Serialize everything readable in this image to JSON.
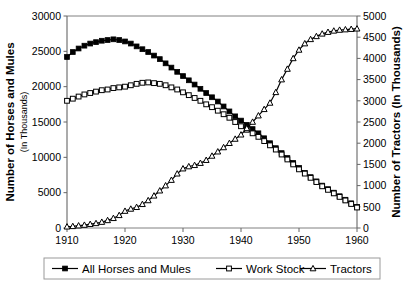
{
  "chart_data": {
    "type": "line",
    "title": "",
    "xlabel": "",
    "ylabel": "Number of Horses and Mules",
    "ylabel_sub": "(In Thousands)",
    "y2label": "Number of Tractors (In Thousands)",
    "grid": false,
    "legend_position": "bottom",
    "xlim": [
      1910,
      1960
    ],
    "xticks": [
      1910,
      1920,
      1930,
      1940,
      1950,
      1960
    ],
    "xtick_labels": [
      "1910",
      "1920",
      "1930",
      "1940",
      "1950",
      "1960"
    ],
    "ylim": [
      0,
      30000
    ],
    "yticks": [
      0,
      5000,
      10000,
      15000,
      20000,
      25000,
      30000
    ],
    "ytick_labels": [
      "0",
      "5000",
      "10000",
      "15000",
      "20000",
      "25000",
      "30000"
    ],
    "y2lim": [
      0,
      5000
    ],
    "y2ticks": [
      0,
      500,
      1000,
      1500,
      2000,
      2500,
      3000,
      3500,
      4000,
      4500,
      5000
    ],
    "y2tick_labels": [
      "0",
      "500",
      "1000",
      "1500",
      "2000",
      "2500",
      "3000",
      "3500",
      "4000",
      "4500",
      "5000"
    ],
    "x": [
      1910,
      1911,
      1912,
      1913,
      1914,
      1915,
      1916,
      1917,
      1918,
      1919,
      1920,
      1921,
      1922,
      1923,
      1924,
      1925,
      1926,
      1927,
      1928,
      1929,
      1930,
      1931,
      1932,
      1933,
      1934,
      1935,
      1936,
      1937,
      1938,
      1939,
      1940,
      1941,
      1942,
      1943,
      1944,
      1945,
      1946,
      1947,
      1948,
      1949,
      1950,
      1951,
      1952,
      1953,
      1954,
      1955,
      1956,
      1957,
      1958,
      1959,
      1960
    ],
    "series": [
      {
        "name": "All Horses and Mules",
        "axis": "left",
        "marker": "filled-square",
        "values": [
          24200,
          24900,
          25400,
          25800,
          26100,
          26300,
          26500,
          26600,
          26700,
          26600,
          26400,
          26100,
          25700,
          25300,
          24900,
          24400,
          23900,
          23300,
          22700,
          22100,
          21500,
          20900,
          20300,
          19700,
          19100,
          18500,
          17900,
          17200,
          16500,
          15800,
          15200,
          14600,
          14000,
          13400,
          12700,
          12000,
          11300,
          10600,
          9900,
          9200,
          8500,
          7800,
          7200,
          6600,
          6000,
          5500,
          5000,
          4500,
          4000,
          3500,
          3000
        ]
      },
      {
        "name": "Work Stock",
        "axis": "left",
        "marker": "open-square",
        "values": [
          18000,
          18300,
          18600,
          18900,
          19100,
          19300,
          19500,
          19600,
          19800,
          19900,
          20000,
          20200,
          20400,
          20550,
          20600,
          20500,
          20400,
          20200,
          19900,
          19600,
          19200,
          18800,
          18400,
          18000,
          17500,
          17100,
          16600,
          16100,
          15600,
          15000,
          14400,
          13900,
          13400,
          12900,
          12300,
          11700,
          11100,
          10400,
          9700,
          9000,
          8300,
          7700,
          7100,
          6500,
          5900,
          5400,
          4900,
          4400,
          3900,
          3400,
          2900
        ]
      },
      {
        "name": "Tractors",
        "axis": "right",
        "marker": "open-triangle",
        "values": [
          30,
          40,
          55,
          70,
          90,
          110,
          140,
          180,
          230,
          300,
          400,
          450,
          490,
          560,
          650,
          760,
          880,
          1000,
          1130,
          1280,
          1400,
          1450,
          1480,
          1530,
          1600,
          1700,
          1800,
          1900,
          2000,
          2100,
          2200,
          2350,
          2500,
          2650,
          2800,
          2950,
          3200,
          3500,
          3750,
          4000,
          4200,
          4350,
          4450,
          4520,
          4580,
          4620,
          4650,
          4670,
          4680,
          4690,
          4700
        ]
      }
    ],
    "legend": [
      {
        "label": "All Horses and Mules",
        "marker": "filled-square"
      },
      {
        "label": "Work Stock",
        "marker": "open-square"
      },
      {
        "label": "Tractors",
        "marker": "open-triangle"
      }
    ]
  }
}
